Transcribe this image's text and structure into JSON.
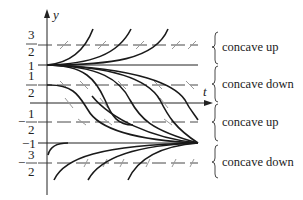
{
  "diagram": {
    "type": "slope-field-solution-curves",
    "axes": {
      "x_label": "t",
      "y_label": "y"
    },
    "y_ticks": [
      {
        "value": 1.5,
        "num": "3",
        "den": "2",
        "sign": ""
      },
      {
        "value": 1,
        "text": "1"
      },
      {
        "value": 0.5,
        "num": "1",
        "den": "2",
        "sign": ""
      },
      {
        "value": -0.5,
        "num": "1",
        "den": "2",
        "sign": "−"
      },
      {
        "value": -1,
        "text": "−1"
      },
      {
        "value": -1.5,
        "num": "3",
        "den": "2",
        "sign": "−"
      }
    ],
    "equilibria": [
      1,
      -1
    ],
    "dashed_levels": [
      1.5,
      0.5,
      -0.5,
      -1.5
    ],
    "regions": [
      {
        "range": "1 < y",
        "label": "concave up"
      },
      {
        "range": "0 < y < 1",
        "label": "concave down"
      },
      {
        "range": "-1 < y < 0",
        "label": "concave up"
      },
      {
        "range": "y < -1",
        "label": "concave down"
      }
    ]
  },
  "labels": {
    "y_axis": "y",
    "t_axis": "t",
    "tick_3_2_num": "3",
    "tick_3_2_den": "2",
    "tick_1": "1",
    "tick_1_2_num": "1",
    "tick_1_2_den": "2",
    "tick_neg_1_2_sign": "−",
    "tick_neg_1_2_num": "1",
    "tick_neg_1_2_den": "2",
    "tick_neg_1": "−1",
    "tick_neg_3_2_sign": "−",
    "tick_neg_3_2_num": "3",
    "tick_neg_3_2_den": "2",
    "region_1": "concave up",
    "region_2": "concave down",
    "region_3": "concave up",
    "region_4": "concave down"
  }
}
